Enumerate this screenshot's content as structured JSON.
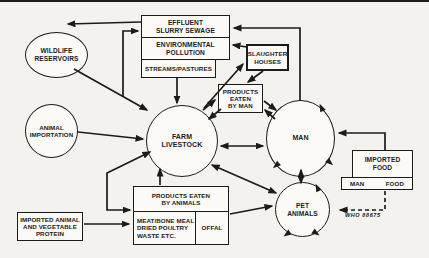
{
  "figure": {
    "credit": "WHO 88675",
    "colors": {
      "background": "#f3f2ef",
      "ink": "#1b1b1b",
      "node_fill": "#fbfaf7"
    }
  },
  "circles": {
    "wildlife": {
      "label": "WILDLIFE\nRESERVOIRS"
    },
    "animal_importation": {
      "label": "ANIMAL\nIMPORTATION"
    },
    "farm_livestock": {
      "label": "FARM\nLIVESTOCK"
    },
    "man": {
      "label": "MAN"
    },
    "pet_animals": {
      "label": "PET\nANIMALS"
    }
  },
  "boxes": {
    "effluent": {
      "label": "EFFLUENT\nSLURRY SEWAGE"
    },
    "environmental_pollution": {
      "label": "ENVIRONMENTAL\nPOLLUTION"
    },
    "streams_pastures": {
      "label": "STREAMS/PASTURES"
    },
    "slaughter_houses": {
      "label": "SLAUGHTER\nHOUSES"
    },
    "products_eaten_by_man": {
      "label": "PRODUCTS\nEATEN\nBY MAN"
    },
    "imported_food": {
      "label": "IMPORTED\nFOOD",
      "sub_left": "MAN",
      "sub_right": "FOOD"
    },
    "products_eaten_by_animals": {
      "header": "PRODUCTS EATEN\nBY ANIMALS",
      "left_cell": "MEAT/BONE MEAL\nDRIED POULTRY\nWASTE ETC.",
      "right_cell": "OFFAL"
    },
    "imported_protein": {
      "label": "IMPORTED ANIMAL\nAND VEGETABLE\nPROTEIN"
    }
  },
  "connections": [
    {
      "from": "EFFLUENT SLURRY SEWAGE",
      "to": "WILDLIFE RESERVOIRS"
    },
    {
      "from": "MAN",
      "to": "EFFLUENT SLURRY SEWAGE"
    },
    {
      "from": "FARM LIVESTOCK",
      "to": "EFFLUENT SLURRY SEWAGE"
    },
    {
      "from": "WILDLIFE RESERVOIRS",
      "to": "FARM LIVESTOCK"
    },
    {
      "from": "SLAUGHTER HOUSES",
      "to": "ENVIRONMENTAL POLLUTION"
    },
    {
      "from": "FARM LIVESTOCK",
      "to": "SLAUGHTER HOUSES"
    },
    {
      "from": "SLAUGHTER HOUSES",
      "to": "PRODUCTS EATEN BY MAN"
    },
    {
      "from": "STREAMS/PASTURES",
      "to": "FARM LIVESTOCK"
    },
    {
      "from": "ANIMAL IMPORTATION",
      "to": "FARM LIVESTOCK"
    },
    {
      "from": "FARM LIVESTOCK",
      "to": "PRODUCTS EATEN BY MAN",
      "bidirectional": true
    },
    {
      "from": "PRODUCTS EATEN BY MAN",
      "to": "MAN",
      "bidirectional": true
    },
    {
      "from": "FARM LIVESTOCK",
      "to": "MAN",
      "bidirectional": true
    },
    {
      "from": "IMPORTED FOOD",
      "to": "MAN"
    },
    {
      "from": "MAN",
      "to": "PET ANIMALS",
      "bidirectional": true
    },
    {
      "from": "FARM LIVESTOCK",
      "to": "PET ANIMALS",
      "bidirectional": true
    },
    {
      "from": "OFFAL",
      "to": "PET ANIMALS"
    },
    {
      "from": "IMPORTED ANIMAL AND VEGETABLE PROTEIN",
      "to": "MEAT/BONE MEAL DRIED POULTRY WASTE ETC."
    },
    {
      "from": "FARM LIVESTOCK",
      "to": "MEAT/BONE MEAL DRIED POULTRY WASTE ETC.",
      "bidirectional": true
    },
    {
      "from": "PRODUCTS EATEN BY ANIMALS",
      "to": "FARM LIVESTOCK"
    },
    {
      "from": "IMPORTED FOOD",
      "to": "PET ANIMALS",
      "style": "dashed"
    }
  ]
}
